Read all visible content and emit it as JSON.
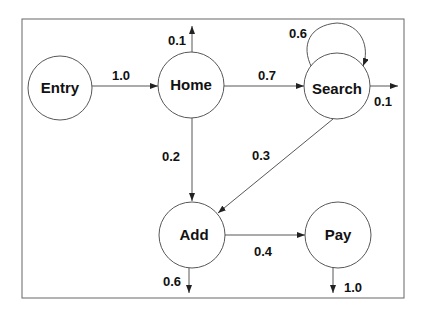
{
  "diagram": {
    "type": "state-transition-diagram",
    "nodes": [
      {
        "id": "entry",
        "label": "Entry"
      },
      {
        "id": "home",
        "label": "Home"
      },
      {
        "id": "search",
        "label": "Search"
      },
      {
        "id": "add",
        "label": "Add"
      },
      {
        "id": "pay",
        "label": "Pay"
      }
    ],
    "edges": [
      {
        "from": "entry",
        "to": "home",
        "label": "1.0"
      },
      {
        "from": "home",
        "to": "exit",
        "label": "0.1"
      },
      {
        "from": "home",
        "to": "search",
        "label": "0.7"
      },
      {
        "from": "home",
        "to": "add",
        "label": "0.2"
      },
      {
        "from": "search",
        "to": "search",
        "label": "0.6"
      },
      {
        "from": "search",
        "to": "exit",
        "label": "0.1"
      },
      {
        "from": "search",
        "to": "add",
        "label": "0.3"
      },
      {
        "from": "add",
        "to": "pay",
        "label": "0.4"
      },
      {
        "from": "add",
        "to": "exit",
        "label": "0.6"
      },
      {
        "from": "pay",
        "to": "exit",
        "label": "1.0"
      }
    ]
  }
}
